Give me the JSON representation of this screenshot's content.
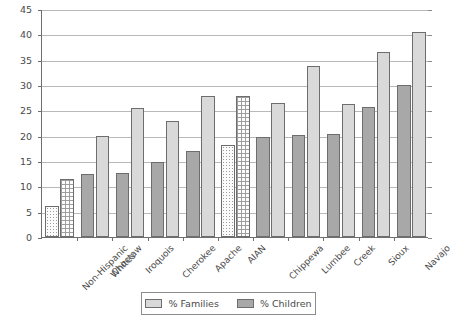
{
  "chart_data": {
    "type": "bar",
    "title": "",
    "xlabel": "",
    "ylabel": "",
    "ylim": [
      0,
      45
    ],
    "ytick_step": 5,
    "yticks": [
      0,
      5,
      10,
      15,
      20,
      25,
      30,
      35,
      40,
      45
    ],
    "grid": true,
    "legend_position": "bottom",
    "categories": [
      "Non-Hispanic\nWhites",
      "Choctaw",
      "Iroquois",
      "Cherokee",
      "Apache",
      "AIAN",
      "Chippewa",
      "Lumbee",
      "Creek",
      "Sioux",
      "Navajo"
    ],
    "series": [
      {
        "name": "% Families",
        "color": "#d9d9d9",
        "values": [
          11.5,
          20.0,
          25.4,
          22.8,
          27.8,
          27.8,
          26.5,
          33.7,
          26.2,
          36.5,
          40.5
        ]
      },
      {
        "name": "% Children",
        "color": "#a8a8a8",
        "values": [
          6.2,
          12.5,
          12.7,
          14.9,
          17.0,
          18.2,
          19.8,
          20.2,
          20.3,
          25.7,
          30.0
        ]
      }
    ],
    "pattern_groups": [
      0,
      5
    ],
    "pattern_note": "Non-Hispanic Whites and AIAN groups drawn with stipple/grid hatch fills"
  },
  "legend": {
    "items": [
      {
        "label": "% Families",
        "swatch": "families"
      },
      {
        "label": "% Children",
        "swatch": "children"
      }
    ]
  },
  "colors": {
    "families": "#d9d9d9",
    "children": "#a8a8a8",
    "axis": "#6f6f6f",
    "grid": "#b9b9b9",
    "text": "#4a4a4a",
    "background": "#ffffff"
  }
}
